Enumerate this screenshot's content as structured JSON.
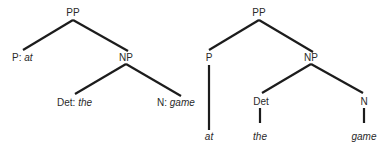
{
  "trees": [
    {
      "name": "flat",
      "root": "PP",
      "nodes": {
        "pp": {
          "category": "PP"
        },
        "p": {
          "category": "P",
          "separator": ": ",
          "word": "at"
        },
        "np": {
          "category": "NP"
        },
        "det": {
          "category": "Det",
          "separator": ": ",
          "word": "the"
        },
        "n": {
          "category": "N",
          "separator": ": ",
          "word": "game"
        }
      }
    },
    {
      "name": "expanded",
      "root": "PP",
      "nodes": {
        "pp": {
          "category": "PP"
        },
        "p": {
          "category": "P"
        },
        "np": {
          "category": "NP"
        },
        "det": {
          "category": "Det"
        },
        "n": {
          "category": "N"
        },
        "at": {
          "word": "at"
        },
        "the": {
          "word": "the"
        },
        "game": {
          "word": "game"
        }
      }
    }
  ]
}
